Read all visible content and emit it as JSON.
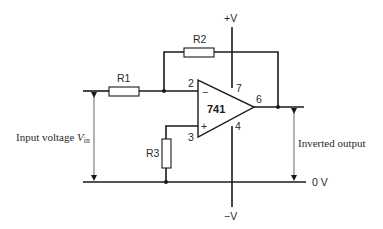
{
  "diagram": {
    "opamp": {
      "label": "741",
      "pins": {
        "inverting": "2",
        "non_inverting": "3",
        "output": "6",
        "v_pos": "7",
        "v_neg": "4"
      },
      "minus_sign": "−",
      "plus_sign": "+"
    },
    "resistors": [
      {
        "label": "R1"
      },
      {
        "label": "R2"
      },
      {
        "label": "R3"
      }
    ],
    "supply": {
      "positive": "+V",
      "negative": "−V",
      "ground": "0 V"
    },
    "annotations": {
      "input_prefix": "Input voltage ",
      "input_symbol": "V",
      "input_subscript": "in",
      "output": "Inverted output"
    }
  }
}
